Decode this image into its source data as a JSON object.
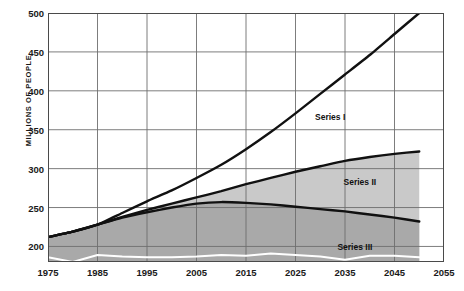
{
  "chart_data": {
    "type": "area",
    "title": "",
    "xlabel": "",
    "ylabel": "MILLIONS OF PEOPLE",
    "xlim": [
      1975,
      2055
    ],
    "ylim": [
      180,
      500
    ],
    "yaxis_ticks": [
      500,
      450,
      400,
      350,
      300,
      250,
      200
    ],
    "xaxis_ticks": [
      1975,
      1985,
      1995,
      2005,
      2015,
      2025,
      2035,
      2045,
      2055
    ],
    "grid": true,
    "legend": "inline-annotations",
    "data_end_year": 2050,
    "x": [
      1975,
      1980,
      1985,
      1990,
      1995,
      2000,
      2005,
      2010,
      2015,
      2020,
      2025,
      2030,
      2035,
      2040,
      2045,
      2050
    ],
    "series": [
      {
        "name": "Series I",
        "label": "Series I",
        "color": "#111111",
        "fill": "none",
        "values": [
          212,
          219,
          228,
          243,
          258,
          272,
          288,
          305,
          325,
          347,
          371,
          396,
          421,
          446,
          473,
          500
        ]
      },
      {
        "name": "Series II",
        "label": "Series II",
        "color": "#111111",
        "fill": "#c9c9c9",
        "values": [
          212,
          219,
          228,
          238,
          247,
          255,
          263,
          271,
          280,
          288,
          296,
          303,
          310,
          315,
          319,
          322
        ]
      },
      {
        "name": "Series III band",
        "label": "",
        "color": "#111111",
        "fill": "#a9a9a9",
        "values": [
          212,
          219,
          228,
          237,
          244,
          250,
          255,
          257,
          256,
          254,
          251,
          248,
          245,
          241,
          237,
          232
        ]
      },
      {
        "name": "Series III",
        "label": "Series III",
        "color": "#ffffff",
        "fill": "none",
        "values": [
          186,
          180,
          189,
          187,
          186,
          186,
          187,
          189,
          188,
          191,
          189,
          187,
          183,
          188,
          188,
          186
        ]
      }
    ],
    "annotations": [
      {
        "text": "Series I",
        "x": 2032,
        "y": 366
      },
      {
        "text": "Series II",
        "x": 2038,
        "y": 283
      },
      {
        "text": "Series III",
        "x": 2037,
        "y": 199
      }
    ]
  },
  "axis": {
    "y_label": "MILLIONS OF PEOPLE",
    "y_ticks": [
      "500",
      "450",
      "400",
      "350",
      "300",
      "250",
      "200"
    ],
    "x_ticks": [
      "1975",
      "1985",
      "1995",
      "2005",
      "2015",
      "2025",
      "2035",
      "2045",
      "2055"
    ]
  },
  "colors": {
    "band_upper": "#c9c9c9",
    "band_lower": "#a9a9a9",
    "line": "#111111",
    "series3_line": "#ffffff",
    "grid": "#6e6e6e",
    "frame": "#4a4a4a",
    "text": "#1a1a1a",
    "background": "#ffffff"
  }
}
